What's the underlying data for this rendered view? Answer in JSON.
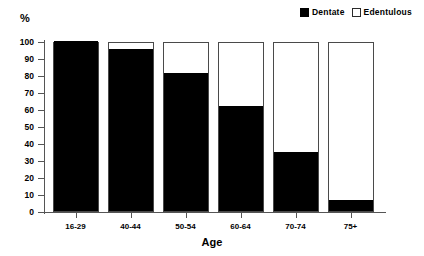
{
  "chart_data": {
    "type": "bar",
    "subtype": "stacked-bar-100-percent",
    "title": "",
    "xlabel": "Age",
    "ylabel": "%",
    "ylim": [
      0,
      100
    ],
    "ytick_step": 10,
    "yticks": [
      0,
      10,
      20,
      30,
      40,
      50,
      60,
      70,
      80,
      90,
      100
    ],
    "ytick_labels": [
      "0",
      "10",
      "20",
      "30",
      "40",
      "50",
      "60",
      "70",
      "80",
      "90",
      "100"
    ],
    "grid": false,
    "legend_position": "top-right",
    "categories": [
      "16-29",
      "40-44",
      "50-54",
      "60-64",
      "70-74",
      "75+"
    ],
    "series": [
      {
        "name": "Dentate",
        "color": "#000000",
        "values": [
          100,
          95.5,
          81,
          61.5,
          34.5,
          6.5
        ]
      },
      {
        "name": "Edentulous",
        "color": "#ffffff",
        "values": [
          0,
          4.5,
          19,
          38.5,
          65.5,
          93.5
        ]
      }
    ]
  },
  "legend": {
    "entries": [
      {
        "label": "Dentate",
        "swatch": "filled-square-icon"
      },
      {
        "label": "Edentulous",
        "swatch": "hollow-square-icon"
      }
    ]
  },
  "axes": {
    "unit_label": "%",
    "x_title": "Age"
  }
}
